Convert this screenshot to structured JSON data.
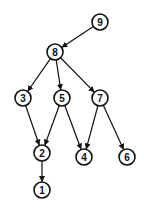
{
  "diagram": {
    "type": "directed-graph",
    "nodes": [
      {
        "id": "9",
        "label": "9",
        "x": 100,
        "y": 22
      },
      {
        "id": "8",
        "label": "8",
        "x": 55,
        "y": 52
      },
      {
        "id": "3",
        "label": "3",
        "x": 23,
        "y": 98
      },
      {
        "id": "5",
        "label": "5",
        "x": 62,
        "y": 98
      },
      {
        "id": "7",
        "label": "7",
        "x": 100,
        "y": 98
      },
      {
        "id": "2",
        "label": "2",
        "x": 42,
        "y": 153
      },
      {
        "id": "4",
        "label": "4",
        "x": 84,
        "y": 157
      },
      {
        "id": "6",
        "label": "6",
        "x": 127,
        "y": 157
      },
      {
        "id": "1",
        "label": "1",
        "x": 42,
        "y": 190
      }
    ],
    "edges": [
      {
        "from": "9",
        "to": "8"
      },
      {
        "from": "8",
        "to": "3"
      },
      {
        "from": "8",
        "to": "5"
      },
      {
        "from": "8",
        "to": "7"
      },
      {
        "from": "3",
        "to": "2"
      },
      {
        "from": "5",
        "to": "2"
      },
      {
        "from": "5",
        "to": "4"
      },
      {
        "from": "7",
        "to": "4"
      },
      {
        "from": "7",
        "to": "6"
      },
      {
        "from": "2",
        "to": "1"
      }
    ],
    "node_radius": 8,
    "colors": {
      "stroke": "#111111",
      "fill": "#ffffff",
      "background": "#ffffff"
    }
  }
}
